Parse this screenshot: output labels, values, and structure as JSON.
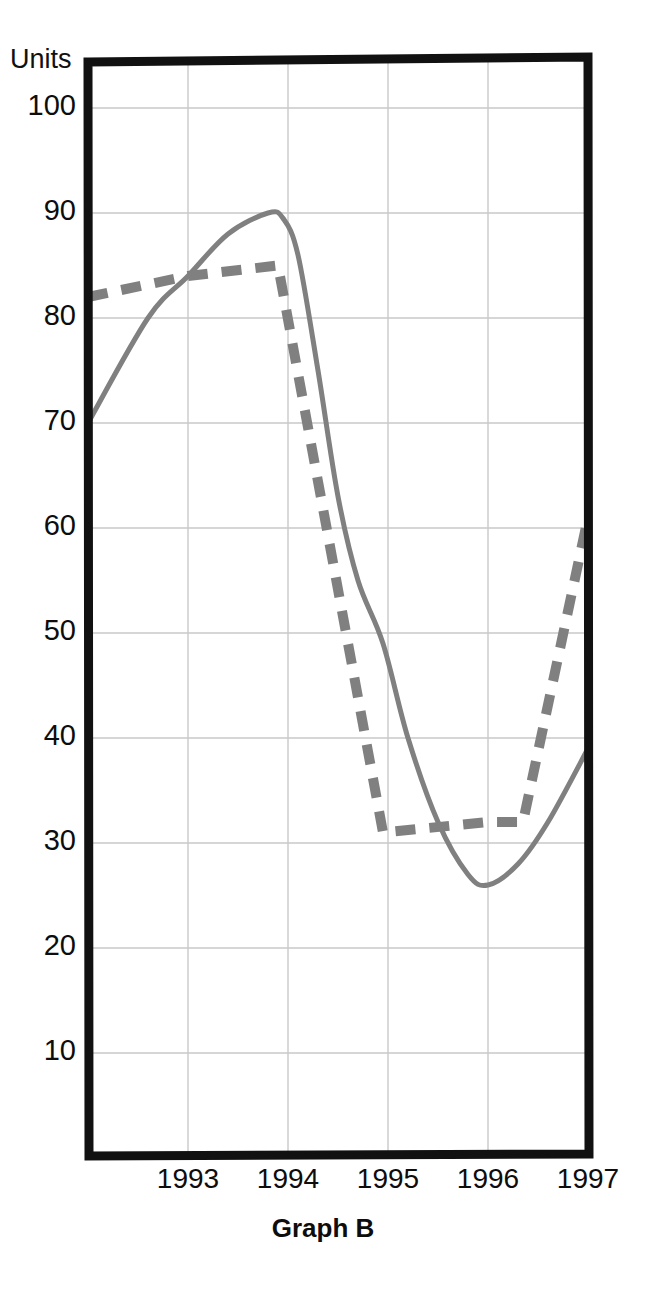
{
  "axis_label": "Units",
  "title": "Graph B",
  "colors": {
    "frame": "#111111",
    "grid": "#c9c9c9",
    "line": "#808080",
    "text": "#0d0d0d",
    "background": "#ffffff"
  },
  "yticks": [
    {
      "value": 100,
      "label": "100"
    },
    {
      "value": 90,
      "label": "90"
    },
    {
      "value": 80,
      "label": "80"
    },
    {
      "value": 70,
      "label": "70"
    },
    {
      "value": 60,
      "label": "60"
    },
    {
      "value": 50,
      "label": "50"
    },
    {
      "value": 40,
      "label": "40"
    },
    {
      "value": 30,
      "label": "30"
    },
    {
      "value": 20,
      "label": "20"
    },
    {
      "value": 10,
      "label": "10"
    }
  ],
  "xticks": [
    {
      "value": 1993,
      "label": "1993"
    },
    {
      "value": 1994,
      "label": "1994"
    },
    {
      "value": 1995,
      "label": "1995"
    },
    {
      "value": 1996,
      "label": "1996"
    },
    {
      "value": 1997,
      "label": "1997"
    }
  ],
  "chart_data": {
    "type": "line",
    "title": "Graph B",
    "xlabel": "",
    "ylabel": "Units",
    "xlim": [
      1992.0,
      1997.0
    ],
    "ylim": [
      0,
      104
    ],
    "grid": true,
    "legend": "none",
    "tick_labels": {
      "x": [
        "1993",
        "1994",
        "1995",
        "1996",
        "1997"
      ],
      "y": [
        "10",
        "20",
        "30",
        "40",
        "50",
        "60",
        "70",
        "80",
        "90",
        "100"
      ]
    },
    "series": [
      {
        "name": "solid-line",
        "style": "solid",
        "color": "#808080",
        "x": [
          1992.0,
          1992.6,
          1993.0,
          1993.4,
          1993.8,
          1993.95,
          1994.1,
          1994.3,
          1994.5,
          1994.7,
          1994.95,
          1995.2,
          1995.5,
          1995.8,
          1996.0,
          1996.3,
          1996.6,
          1997.0
        ],
        "y": [
          70,
          80,
          84,
          88,
          90,
          89.5,
          86,
          75,
          63,
          55,
          49,
          40,
          32,
          27,
          26,
          28,
          32,
          39
        ]
      },
      {
        "name": "dashed-line",
        "style": "dashed",
        "color": "#808080",
        "x": [
          1992.0,
          1993.0,
          1993.9,
          1994.95,
          1996.0,
          1996.35,
          1997.0
        ],
        "y": [
          82,
          84,
          85,
          31,
          32,
          32,
          61
        ]
      }
    ]
  }
}
